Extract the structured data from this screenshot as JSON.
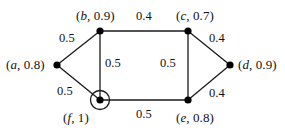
{
  "figure": {
    "kind": "undirected-weighted-graph",
    "width": 285,
    "height": 130,
    "background_color": "#ffffff",
    "stroke_color": "#1a1a1a",
    "node_fill_color": "#000000",
    "highlight_color": "#000000"
  },
  "nodes": [
    {
      "id": "a",
      "name": "a",
      "value": "0.8",
      "label": "(a, 0.8)",
      "x": 57,
      "y": 65,
      "highlighted": false,
      "label_anchor": "left"
    },
    {
      "id": "b",
      "name": "b",
      "value": "0.9",
      "label": "(b, 0.9)",
      "x": 100,
      "y": 31,
      "highlighted": false,
      "label_anchor": "above"
    },
    {
      "id": "c",
      "name": "c",
      "value": "0.7",
      "label": "(c, 0.7)",
      "x": 188,
      "y": 31,
      "highlighted": false,
      "label_anchor": "above"
    },
    {
      "id": "d",
      "name": "d",
      "value": "0.9",
      "label": "(d, 0.9)",
      "x": 230,
      "y": 65,
      "highlighted": false,
      "label_anchor": "right"
    },
    {
      "id": "e",
      "name": "e",
      "value": "0.8",
      "label": "(e, 0.8)",
      "x": 188,
      "y": 100,
      "highlighted": false,
      "label_anchor": "below"
    },
    {
      "id": "f",
      "name": "f",
      "value": "1",
      "label": "(f, 1)",
      "x": 100,
      "y": 100,
      "highlighted": true,
      "label_anchor": "below"
    }
  ],
  "edges": [
    {
      "id": "ab",
      "source": "a",
      "target": "b",
      "weight": "0.5"
    },
    {
      "id": "bc",
      "source": "b",
      "target": "c",
      "weight": "0.4"
    },
    {
      "id": "cd",
      "source": "c",
      "target": "d",
      "weight": "0.4"
    },
    {
      "id": "bf",
      "source": "b",
      "target": "f",
      "weight": "0.5"
    },
    {
      "id": "ce",
      "source": "c",
      "target": "e",
      "weight": "0.5"
    },
    {
      "id": "af",
      "source": "a",
      "target": "f",
      "weight": "0.5"
    },
    {
      "id": "de",
      "source": "d",
      "target": "e",
      "weight": "0.4"
    },
    {
      "id": "ef",
      "source": "e",
      "target": "f",
      "weight": "0.5"
    }
  ],
  "node_labels": {
    "a": {
      "open": "(",
      "vname": "a",
      "sep": ", ",
      "value": "0.8",
      "close": ")"
    },
    "b": {
      "open": "(",
      "vname": "b",
      "sep": ", ",
      "value": "0.9",
      "close": ")"
    },
    "c": {
      "open": "(",
      "vname": "c",
      "sep": ", ",
      "value": "0.7",
      "close": ")"
    },
    "d": {
      "open": "(",
      "vname": "d",
      "sep": ", ",
      "value": "0.9",
      "close": ")"
    },
    "e": {
      "open": "(",
      "vname": "e",
      "sep": ", ",
      "value": "0.8",
      "close": ")"
    },
    "f": {
      "open": "(",
      "vname": "f",
      "sep": ", ",
      "value": "1",
      "close": ")"
    }
  },
  "edge_weights": {
    "ab": "0.5",
    "bc": "0.4",
    "cd": "0.4",
    "bf": "0.5",
    "ce": "0.5",
    "af": "0.5",
    "de": "0.4",
    "ef": "0.5"
  }
}
